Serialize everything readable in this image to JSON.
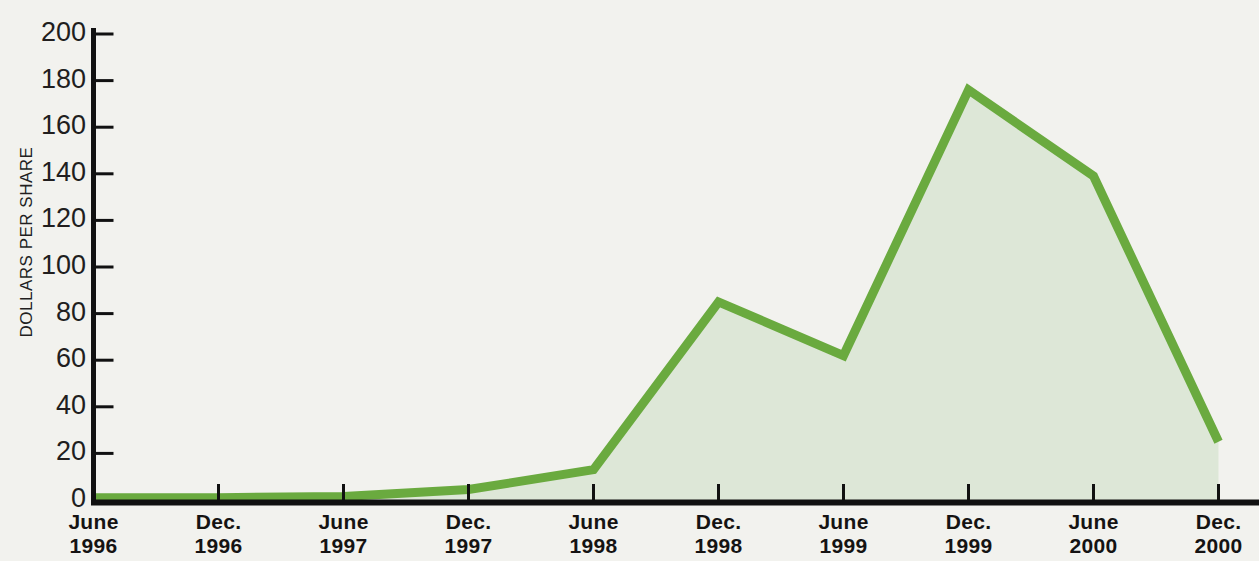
{
  "chart_data": {
    "type": "area",
    "title": "",
    "xlabel": "",
    "ylabel": "DOLLARS PER SHARE",
    "ylim": [
      0,
      200
    ],
    "yticks": [
      0,
      20,
      40,
      60,
      80,
      100,
      120,
      140,
      160,
      180,
      200
    ],
    "ytick_labels": [
      "0",
      "20",
      "40",
      "60",
      "80",
      "100",
      "120",
      "140",
      "160",
      "180",
      "200"
    ],
    "grid": false,
    "legend": null,
    "categories": [
      "June 1996",
      "Dec. 1996",
      "June 1997",
      "Dec. 1997",
      "June 1998",
      "Dec. 1998",
      "June 1999",
      "Dec. 1999",
      "June 2000",
      "Dec. 2000"
    ],
    "xtick_labels": [
      {
        "month": "June",
        "year": "1996"
      },
      {
        "month": "Dec.",
        "year": "1996"
      },
      {
        "month": "June",
        "year": "1997"
      },
      {
        "month": "Dec.",
        "year": "1997"
      },
      {
        "month": "June",
        "year": "1998"
      },
      {
        "month": "Dec.",
        "year": "1998"
      },
      {
        "month": "June",
        "year": "1999"
      },
      {
        "month": "Dec.",
        "year": "1999"
      },
      {
        "month": "June",
        "year": "2000"
      },
      {
        "month": "Dec.",
        "year": "2000"
      }
    ],
    "values": [
      1,
      1,
      1.5,
      4.5,
      13,
      85,
      62,
      176,
      139,
      25
    ],
    "series": [
      {
        "name": "Dollars per share",
        "values": [
          1,
          1,
          1.5,
          4.5,
          13,
          85,
          62,
          176,
          139,
          25
        ]
      }
    ],
    "colors": {
      "line": "#6aaa3f",
      "fill": "#dde7d7",
      "axis": "#111111",
      "background": "#f2f2ee",
      "text": "#1a1818"
    }
  }
}
